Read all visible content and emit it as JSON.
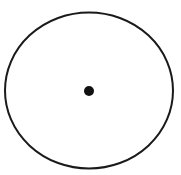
{
  "canvas": {
    "width": 181,
    "height": 175,
    "background_color": "#ffffff"
  },
  "figure": {
    "name": "circle-with-center-point",
    "stroke_color": "#1a1a1a",
    "fill_color": "none"
  },
  "shapes": {
    "outer_circle": {
      "label": "outer-circle",
      "center_x": 89,
      "center_y": 90.5,
      "radius_x": 84,
      "radius_y": 78,
      "stroke_width": 2,
      "stroke_color": "#1a1a1a",
      "fill": "none"
    },
    "center_dot": {
      "label": "center-dot",
      "center_x": 89,
      "center_y": 91,
      "radius": 5,
      "fill_color": "#111111",
      "stroke_width": 0
    }
  },
  "caption": ""
}
